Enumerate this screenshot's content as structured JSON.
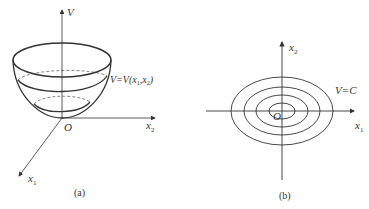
{
  "panel_a": {
    "axis_v_label": "V",
    "axis_x2_label": "x",
    "axis_x2_sub": "2",
    "axis_x1_label": "x",
    "axis_x1_sub": "1",
    "origin_label": "O",
    "surface_label_pre": "V=V(x",
    "surface_label_sub1": "1",
    "surface_label_mid": ",x",
    "surface_label_sub2": "2",
    "surface_label_post": ")",
    "caption": "(a)"
  },
  "panel_b": {
    "axis_x2_label": "x",
    "axis_x2_sub": "2",
    "axis_x1_label": "x",
    "axis_x1_sub": "1",
    "origin_label": "O",
    "contour_label": "V=C",
    "caption": "(b)",
    "contour_count": 4
  },
  "colors": {
    "line": "#333333",
    "background": "#ffffff"
  }
}
